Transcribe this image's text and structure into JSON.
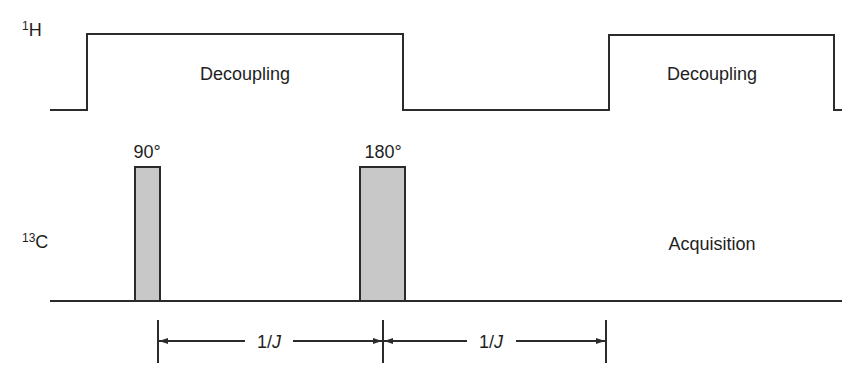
{
  "diagram": {
    "channels": [
      {
        "id": "H",
        "mass": "1",
        "symbol": "H"
      },
      {
        "id": "C",
        "mass": "13",
        "symbol": "C"
      }
    ],
    "h_blocks": [
      {
        "label": "Decoupling"
      },
      {
        "label": "Decoupling"
      }
    ],
    "c_pulses": [
      {
        "label": "90°"
      },
      {
        "label": "180°"
      }
    ],
    "acquisition_label": "Acquisition",
    "delays": [
      {
        "label": "1/J"
      },
      {
        "label": "1/J"
      }
    ]
  }
}
